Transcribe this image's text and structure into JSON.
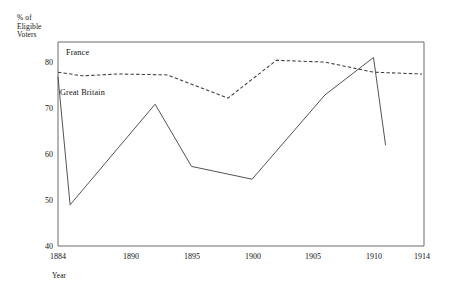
{
  "chart_data": {
    "type": "line",
    "title": "",
    "xlabel": "Year",
    "ylabel": "% of Eligible Voters",
    "ylabel_lines": [
      "% of",
      "Eligible",
      "Voters"
    ],
    "xlim": [
      1884,
      1914
    ],
    "ylim": [
      40,
      84
    ],
    "yticks": [
      40,
      50,
      60,
      70,
      80
    ],
    "ytick_labels": [
      "40",
      "50",
      "60",
      "70",
      "80"
    ],
    "xticks": [
      1884,
      1890,
      1895,
      1900,
      1905,
      1910,
      1914
    ],
    "xtick_labels": [
      "1884",
      "1890",
      "1895",
      "1900",
      "1905",
      "1910",
      "1914"
    ],
    "grid": false,
    "legend": "inline-annotations",
    "series": [
      {
        "name": "France",
        "style": "dashed",
        "color": "#3d3d3d",
        "label_position": "upper-left",
        "x": [
          1884,
          1886,
          1889,
          1893,
          1898,
          1902,
          1906,
          1910,
          1914
        ],
        "values": [
          78.0,
          77.2,
          77.6,
          77.4,
          72.3,
          80.6,
          80.2,
          78.0,
          77.6
        ]
      },
      {
        "name": "Great Britain",
        "style": "solid",
        "color": "#4a4a4a",
        "label_position": "left-middle",
        "x": [
          1884,
          1885,
          1892,
          1895,
          1900,
          1906,
          1910,
          1911
        ],
        "values": [
          77.0,
          49.0,
          71.0,
          57.4,
          54.6,
          73.0,
          81.2,
          62.0
        ]
      }
    ],
    "annotations": [
      {
        "text": "France",
        "x": 1890,
        "y": 82.5
      },
      {
        "text": "Great Britain",
        "x": 1887,
        "y": 73.5
      }
    ]
  }
}
